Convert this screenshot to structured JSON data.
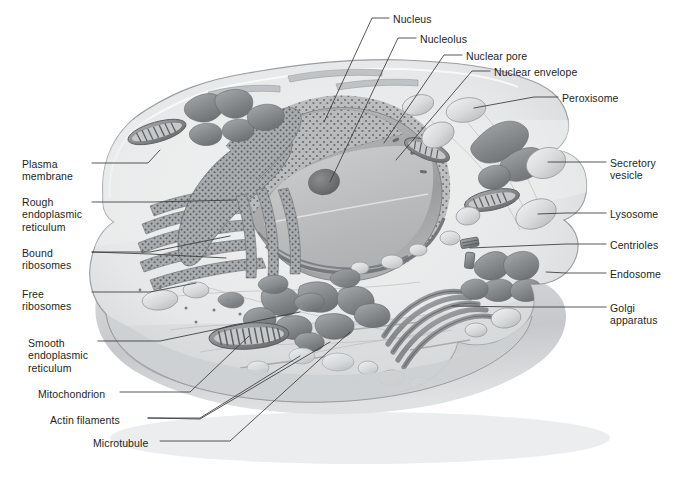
{
  "figure": {
    "palette": {
      "background": "#ffffff",
      "cytoplasm": "#e9eaeb",
      "cytoplasm_dark": "#c9cbcd",
      "membrane_line": "#9a9da1",
      "nucleus_fill": "#a9abad",
      "nucleus_top": "#bdbfc1",
      "nucleolus": "#6f7173",
      "organelle_dark": "#7d8083",
      "organelle_mid": "#a3a6a9",
      "organelle_light": "#d6d8da",
      "leader_line": "#3a3a3a",
      "text": "#231f20"
    }
  },
  "labels": {
    "left": [
      {
        "id": "plasma-membrane",
        "text": "Plasma\nmembrane",
        "x": 22,
        "y": 158
      },
      {
        "id": "rough-er",
        "text": "Rough\nendoplasmic\nreticulum",
        "x": 22,
        "y": 196
      },
      {
        "id": "bound-ribosomes",
        "text": "Bound\nribosomes",
        "x": 22,
        "y": 247
      },
      {
        "id": "free-ribosomes",
        "text": "Free\nribosomes",
        "x": 22,
        "y": 288
      },
      {
        "id": "smooth-er",
        "text": "Smooth\nendoplasmic\nreticulum",
        "x": 28,
        "y": 337
      },
      {
        "id": "mitochondrion",
        "text": "Mitochondrion",
        "x": 38,
        "y": 388
      },
      {
        "id": "actin-filaments",
        "text": "Actin filaments",
        "x": 50,
        "y": 414
      },
      {
        "id": "microtubule",
        "text": "Microtubule",
        "x": 93,
        "y": 437
      }
    ],
    "top": [
      {
        "id": "nucleus",
        "text": "Nucleus",
        "x": 393,
        "y": 13
      },
      {
        "id": "nucleolus",
        "text": "Nucleolus",
        "x": 420,
        "y": 33
      },
      {
        "id": "nuclear-pore",
        "text": "Nuclear pore",
        "x": 466,
        "y": 50
      },
      {
        "id": "nuclear-envelope",
        "text": "Nuclear envelope",
        "x": 494,
        "y": 66
      }
    ],
    "right": [
      {
        "id": "peroxisome",
        "text": "Peroxisome",
        "x": 562,
        "y": 92
      },
      {
        "id": "secretory-vesicle",
        "text": "Secretory\nvesicle",
        "x": 610,
        "y": 157
      },
      {
        "id": "lysosome",
        "text": "Lysosome",
        "x": 610,
        "y": 208
      },
      {
        "id": "centrioles",
        "text": "Centrioles",
        "x": 610,
        "y": 239
      },
      {
        "id": "endosome",
        "text": "Endosome",
        "x": 610,
        "y": 268
      },
      {
        "id": "golgi-apparatus",
        "text": "Golgi\napparatus",
        "x": 610,
        "y": 302
      }
    ]
  },
  "leaders": {
    "plasma_membrane": "M 92,163 L 148,163 L 160,150",
    "rough_er": "M 92,202 L 152,202 L 236,200",
    "bound_ribosomes_a": "M 92,252 L 150,252 L 230,236",
    "bound_ribosomes_b": "M 92,252 L 150,254 L 226,258",
    "free_ribosomes": "M 92,292 L 150,292 L 196,283",
    "smooth_er": "M 98,341 L 160,341 L 300,312",
    "mitochondrion": "M 120,392 L 190,392 L 249,336",
    "actin_filaments_a": "M 148,418 L 200,418 L 300,356",
    "actin_filaments_b": "M 148,418 L 200,419 L 330,342",
    "microtubule": "M 160,441 L 230,441 L 350,332",
    "nucleus": "M 389,18 L 372,18 L 324,122",
    "nucleolus": "M 416,38 L 398,38 L 330,182",
    "nuclear_pore": "M 462,55 L 444,55 L 384,143",
    "nuclear_envelope": "M 490,71 L 472,71 L 396,160",
    "peroxisome": "M 558,97 L 534,97 L 474,108",
    "secretory_vesicle": "M 606,162 L 566,162 L 548,162",
    "lysosome": "M 606,213 L 566,213 L 538,214",
    "centrioles": "M 606,244 L 566,244 L 470,248",
    "endosome": "M 606,273 L 566,273 L 546,272",
    "golgi_apparatus": "M 606,307 L 520,307 L 452,306"
  }
}
